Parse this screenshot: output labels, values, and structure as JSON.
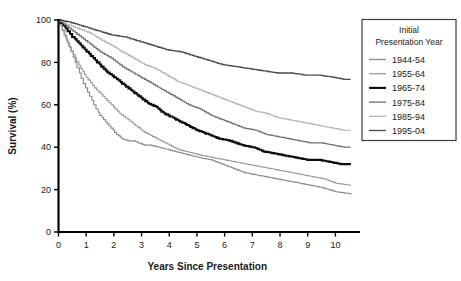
{
  "chart_data": {
    "type": "line",
    "title": "",
    "xlabel": "Years Since Presentation",
    "ylabel": "Survival (%)",
    "xlim": [
      0,
      10.6
    ],
    "ylim": [
      0,
      100
    ],
    "xticks": [
      "0",
      "1",
      "2",
      "3",
      "4",
      "5",
      "6",
      "7",
      "8",
      "9",
      "10"
    ],
    "yticks": [
      "0",
      "20",
      "40",
      "60",
      "80",
      "100"
    ],
    "grid": false,
    "legend_position": "right-top",
    "legend_title": "Initial Presentation Year",
    "legend_title_line1": "Initial",
    "legend_title_line2": "Presentation Year",
    "series": [
      {
        "name": "1944-54",
        "color": "#8a8a8a",
        "width": 1.1,
        "endpoint": 18,
        "x": [
          0,
          0.15,
          0.3,
          0.45,
          0.6,
          0.75,
          0.9,
          1.05,
          1.2,
          1.35,
          1.5,
          1.7,
          1.9,
          2.1,
          2.3,
          2.5,
          2.7,
          2.9,
          3.1,
          3.3,
          3.6,
          3.9,
          4.2,
          4.5,
          4.8,
          5.1,
          5.5,
          5.9,
          6.3,
          6.7,
          7.1,
          7.5,
          7.9,
          8.3,
          8.7,
          9.1,
          9.5,
          10.0,
          10.55
        ],
        "y": [
          100,
          95,
          90,
          85,
          80,
          75,
          70,
          66,
          62,
          58,
          55,
          52,
          49,
          46,
          44,
          43,
          43,
          42,
          41,
          41,
          40,
          39,
          38,
          37,
          36,
          35,
          34,
          32,
          30,
          28,
          27,
          26,
          25,
          24,
          23,
          22,
          21,
          19,
          18
        ]
      },
      {
        "name": "1955-64",
        "color": "#9a9a9a",
        "width": 1.1,
        "endpoint": 22,
        "x": [
          0,
          0.2,
          0.4,
          0.6,
          0.8,
          1.0,
          1.3,
          1.6,
          1.9,
          2.2,
          2.5,
          2.8,
          3.1,
          3.4,
          3.7,
          4.0,
          4.3,
          4.6,
          4.9,
          5.2,
          5.6,
          6.0,
          6.4,
          6.8,
          7.2,
          7.6,
          8.0,
          8.4,
          8.8,
          9.2,
          9.6,
          10.0,
          10.55
        ],
        "y": [
          100,
          93,
          87,
          82,
          77,
          73,
          68,
          64,
          60,
          56,
          53,
          50,
          47,
          45,
          43,
          41,
          39,
          38,
          37,
          36,
          35,
          34,
          33,
          32,
          31,
          30,
          29,
          28,
          27,
          26,
          25,
          23,
          22
        ]
      },
      {
        "name": "1965-74",
        "color": "#0d0d0d",
        "width": 2.1,
        "endpoint": 32,
        "x": [
          0,
          0.25,
          0.5,
          0.8,
          1.1,
          1.4,
          1.7,
          2.0,
          2.3,
          2.6,
          2.9,
          3.2,
          3.5,
          3.8,
          4.1,
          4.4,
          4.7,
          5.0,
          5.4,
          5.8,
          6.2,
          6.6,
          7.0,
          7.4,
          7.8,
          8.2,
          8.6,
          9.0,
          9.4,
          9.8,
          10.2,
          10.55
        ],
        "y": [
          100,
          96,
          92,
          88,
          84,
          80,
          76,
          73,
          70,
          67,
          64,
          61,
          59,
          56,
          54,
          52,
          50,
          48,
          46,
          44,
          43,
          41,
          40,
          38,
          37,
          36,
          35,
          34,
          34,
          33,
          32,
          32
        ]
      },
      {
        "name": "1975-84",
        "color": "#6e6e6e",
        "width": 1.2,
        "endpoint": 40,
        "x": [
          0,
          0.3,
          0.6,
          0.9,
          1.2,
          1.5,
          1.9,
          2.3,
          2.7,
          3.1,
          3.5,
          3.9,
          4.3,
          4.7,
          5.1,
          5.5,
          5.9,
          6.3,
          6.7,
          7.1,
          7.5,
          7.9,
          8.3,
          8.7,
          9.1,
          9.5,
          9.9,
          10.3,
          10.55
        ],
        "y": [
          100,
          97,
          94,
          91,
          88,
          85,
          82,
          78,
          75,
          72,
          69,
          66,
          63,
          60,
          58,
          55,
          53,
          51,
          49,
          48,
          46,
          45,
          44,
          43,
          42,
          42,
          41,
          40,
          40
        ]
      },
      {
        "name": "1985-94",
        "color": "#b4b4b4",
        "width": 1.2,
        "endpoint": 48,
        "x": [
          0,
          0.3,
          0.7,
          1.1,
          1.5,
          1.9,
          2.3,
          2.7,
          3.1,
          3.5,
          3.9,
          4.3,
          4.7,
          5.1,
          5.5,
          5.9,
          6.3,
          6.7,
          7.1,
          7.5,
          7.9,
          8.3,
          8.7,
          9.1,
          9.5,
          9.9,
          10.3,
          10.55
        ],
        "y": [
          100,
          98,
          96,
          94,
          91,
          88,
          85,
          82,
          79,
          77,
          74,
          71,
          69,
          67,
          65,
          63,
          61,
          59,
          57,
          56,
          54,
          53,
          52,
          51,
          50,
          49,
          48,
          48
        ]
      },
      {
        "name": "1995-04",
        "color": "#4a4a4a",
        "width": 1.3,
        "endpoint": 72,
        "x": [
          0,
          0.4,
          0.9,
          1.4,
          1.9,
          2.4,
          2.9,
          3.4,
          3.9,
          4.4,
          4.9,
          5.4,
          5.9,
          6.4,
          6.9,
          7.4,
          7.9,
          8.4,
          8.9,
          9.4,
          9.9,
          10.3,
          10.55
        ],
        "y": [
          100,
          99,
          97,
          95,
          93,
          92,
          90,
          88,
          86,
          85,
          83,
          81,
          79,
          78,
          77,
          76,
          75,
          75,
          74,
          74,
          73,
          72,
          72
        ]
      }
    ]
  }
}
